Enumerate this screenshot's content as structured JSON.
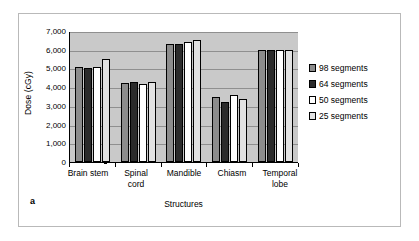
{
  "figure": {
    "caption_letter": "a"
  },
  "chart_data": {
    "type": "bar",
    "title": "",
    "xlabel": "Structures",
    "ylabel": "Dose (cGy)",
    "categories": [
      "Brain stem",
      "Spinal cord",
      "Mandible",
      "Chiasm",
      "Temporal lobe"
    ],
    "category_lines": [
      [
        "Brain stem"
      ],
      [
        "Spinal",
        "cord"
      ],
      [
        "Mandible"
      ],
      [
        "Chiasm"
      ],
      [
        "Temporal",
        "lobe"
      ]
    ],
    "series": [
      {
        "name": "98 segments",
        "color": "#8c8c8c",
        "values": [
          5100,
          4200,
          6300,
          3500,
          6000
        ]
      },
      {
        "name": "64 segments",
        "color": "#2b2b2b",
        "values": [
          5050,
          4250,
          6300,
          3200,
          6000
        ]
      },
      {
        "name": "50 segments",
        "color": "#ffffff",
        "values": [
          5100,
          4150,
          6400,
          3600,
          6000
        ]
      },
      {
        "name": "25 segments",
        "color": "#e2e2e2",
        "values": [
          5500,
          4250,
          6500,
          3350,
          6000
        ]
      }
    ],
    "ylim": [
      0,
      7000
    ],
    "ytick_labels": [
      "7,000",
      "6,000",
      "5,000",
      "4,000",
      "3,000",
      "2,000",
      "1,000",
      "0"
    ],
    "ytick_values": [
      7000,
      6000,
      5000,
      4000,
      3000,
      2000,
      1000,
      0
    ],
    "grid": true,
    "legend_position": "right",
    "plot_background": "#c9c9c9",
    "gridline_color": "#8f8f8f",
    "axis_color": "#000000"
  }
}
